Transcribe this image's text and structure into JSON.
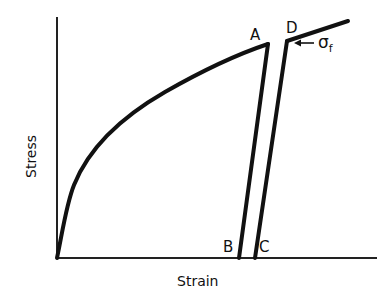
{
  "diagram": {
    "type": "stress-strain curve",
    "axes": {
      "xlabel": "Strain",
      "ylabel": "Stress"
    },
    "points": {
      "A": "A",
      "B": "B",
      "C": "C",
      "D": "D"
    },
    "annotation": {
      "symbol": "σ",
      "subscript": "f",
      "arrow": "left"
    },
    "colors": {
      "line": "#111111",
      "background": "#ffffff"
    }
  }
}
